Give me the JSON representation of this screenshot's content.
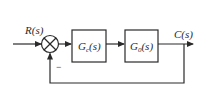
{
  "diagram": {
    "type": "feedback-control-block-diagram",
    "input": {
      "label": "R(s)"
    },
    "summing_junction": {
      "feedback_sign": "−"
    },
    "blocks": [
      {
        "label": "Gc(s)",
        "main": "G",
        "sub": "c",
        "arg": "(s)"
      },
      {
        "label": "G0(s)",
        "main": "G",
        "sub": "0",
        "arg": "(s)"
      }
    ],
    "output": {
      "label": "C(s)"
    },
    "feedback": "unity",
    "colors": {
      "stroke": "#2a2a2a",
      "background": "#ffffff"
    }
  }
}
